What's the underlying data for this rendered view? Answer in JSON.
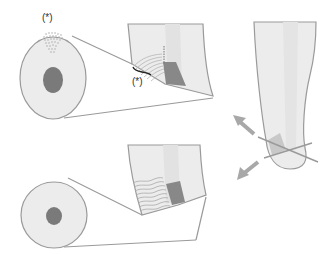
{
  "diagram": {
    "title": "",
    "labels": {
      "top_disc_marker": "(*)",
      "top_bracket_marker": "(*)"
    },
    "colors": {
      "outline": "#9a9a9a",
      "fill_light": "#ececec",
      "fill_mid": "#dcdcdc",
      "core": "#7a7a7a",
      "block": "#888888",
      "arrow": "#a8a8a8",
      "bracket": "#222222"
    },
    "panels": [
      {
        "id": "top-cross-section",
        "description": "Disc cross-section with dotted region and dark core, linked to magnified finger section with wavy layers and marked bracket"
      },
      {
        "id": "bottom-cross-section",
        "description": "Disc cross-section with small dark core, linked to magnified finger section with wavy layers"
      },
      {
        "id": "fingertip",
        "description": "Fingertip with crossing cut lines and two diverging arrows"
      }
    ]
  }
}
